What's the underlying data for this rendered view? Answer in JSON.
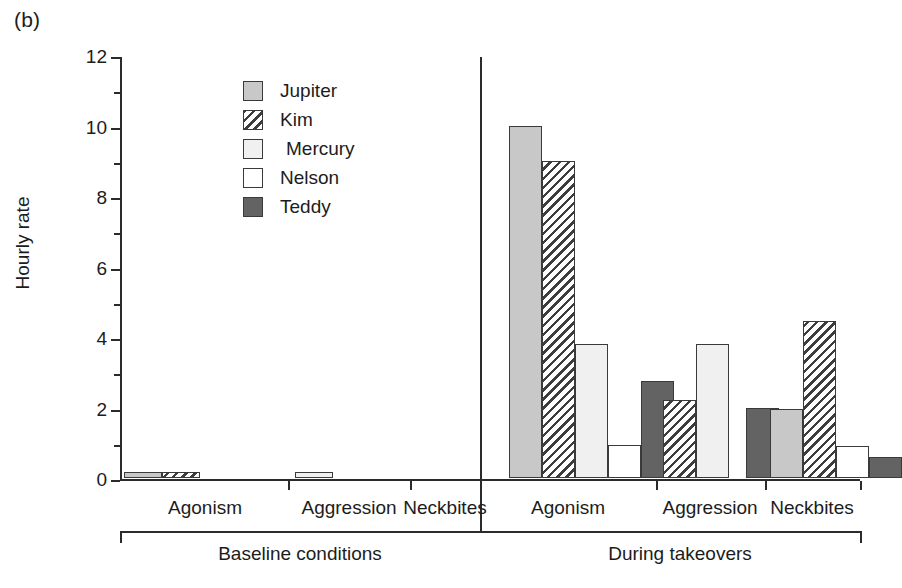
{
  "figure": {
    "panel_label": "(b)",
    "ylabel": "Hourly rate"
  },
  "legend": {
    "items": [
      {
        "label": "Jupiter",
        "key": "jupiter",
        "pattern": "solid-medium-gray",
        "color": "#c8c8c8"
      },
      {
        "label": "Kim",
        "key": "kim",
        "pattern": "diagonal-hatch",
        "color": "#ffffff"
      },
      {
        "label": "Mercury",
        "key": "mercury",
        "pattern": "solid-very-light-gray",
        "color": "#f0f0f0"
      },
      {
        "label": "Nelson",
        "key": "nelson",
        "pattern": "solid-white",
        "color": "#ffffff"
      },
      {
        "label": "Teddy",
        "key": "teddy",
        "pattern": "solid-dark-gray",
        "color": "#636363"
      }
    ]
  },
  "chart_data": {
    "type": "bar",
    "title": "",
    "subtitle": "",
    "xlabel": "",
    "ylabel": "Hourly rate",
    "ylim": [
      0,
      12
    ],
    "yticks": [
      0,
      2,
      4,
      6,
      8,
      10,
      12
    ],
    "ytick_labels": [
      "0",
      "2",
      "4",
      "6",
      "8",
      "10",
      "12"
    ],
    "grid": false,
    "legend_position": "inside-upper-left",
    "groups": [
      {
        "condition": "Baseline conditions",
        "categories": [
          "Agonism",
          "Aggression",
          "Neckbites"
        ]
      },
      {
        "condition": "During takeovers",
        "categories": [
          "Agonism",
          "Aggression",
          "Neckbites"
        ]
      }
    ],
    "categories": [
      "Baseline conditions / Agonism",
      "Baseline conditions / Aggression",
      "Baseline conditions / Neckbites",
      "During takeovers / Agonism",
      "During takeovers / Aggression",
      "During takeovers / Neckbites"
    ],
    "series": [
      {
        "name": "Jupiter",
        "values": [
          0.18,
          0,
          0,
          10.0,
          0,
          1.95
        ]
      },
      {
        "name": "Kim",
        "values": [
          0.17,
          0,
          0,
          9.0,
          2.2,
          4.45
        ]
      },
      {
        "name": "Mercury",
        "values": [
          0,
          0.17,
          0,
          3.8,
          3.8,
          0
        ]
      },
      {
        "name": "Nelson",
        "values": [
          0,
          0,
          0,
          0.95,
          0,
          0.9
        ]
      },
      {
        "name": "Teddy",
        "values": [
          0,
          0,
          0,
          2.75,
          2.0,
          0.6
        ]
      }
    ]
  },
  "axis": {
    "baseline_condition_label": "Baseline conditions",
    "takeover_condition_label": "During takeovers",
    "category_labels": [
      "Agonism",
      "Aggression",
      "Neckbites",
      "Agonism",
      "Aggression",
      "Neckbites"
    ]
  }
}
